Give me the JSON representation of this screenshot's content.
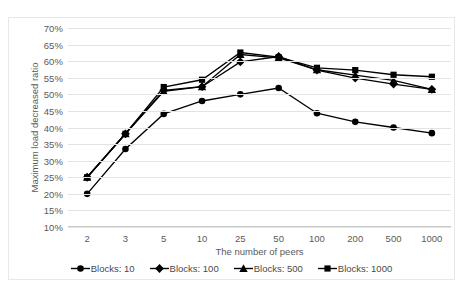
{
  "chart_data": {
    "type": "line",
    "title": "",
    "xlabel": "The number of peers",
    "ylabel": "Maximum load decreased ratio",
    "categories": [
      "2",
      "3",
      "5",
      "10",
      "25",
      "50",
      "100",
      "200",
      "500",
      "1000"
    ],
    "yticks": [
      "10%",
      "15%",
      "20%",
      "25%",
      "30%",
      "35%",
      "40%",
      "45%",
      "50%",
      "55%",
      "60%",
      "65%",
      "70%"
    ],
    "ytick_values": [
      10,
      15,
      20,
      25,
      30,
      35,
      40,
      45,
      50,
      55,
      60,
      65,
      70
    ],
    "ylim": [
      10,
      70
    ],
    "yunit": "%",
    "grid": true,
    "legend_position": "bottom",
    "series": [
      {
        "name": "Blocks: 10",
        "marker": "circle",
        "color": "#000000",
        "values": [
          20.0,
          33.5,
          44.1,
          48.0,
          50.0,
          51.9,
          44.3,
          41.7,
          40.0,
          38.3
        ]
      },
      {
        "name": "Blocks: 100",
        "marker": "diamond",
        "color": "#000000",
        "values": [
          25.0,
          38.1,
          51.2,
          52.3,
          59.8,
          61.4,
          57.3,
          54.9,
          53.1,
          51.5
        ]
      },
      {
        "name": "Blocks: 500",
        "marker": "triangle",
        "color": "#000000",
        "values": [
          25.0,
          38.1,
          50.9,
          52.3,
          62.0,
          61.0,
          57.4,
          55.8,
          54.2,
          51.5
        ]
      },
      {
        "name": "Blocks: 1000",
        "marker": "square",
        "color": "#000000",
        "values": [
          25.0,
          38.1,
          52.2,
          54.4,
          62.6,
          61.2,
          58.0,
          57.3,
          55.9,
          55.3
        ]
      }
    ]
  }
}
